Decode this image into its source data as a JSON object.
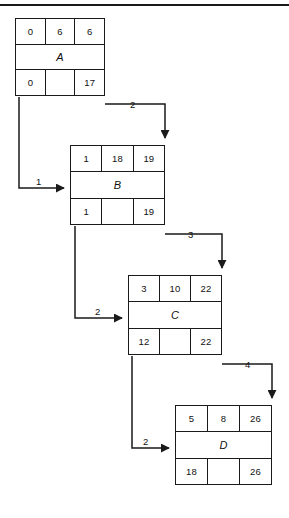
{
  "figure": {
    "top_rule_color": "#1a1a1a",
    "line_color": "#1a1a1a",
    "background": "#ffffff"
  },
  "blocks": [
    {
      "id": "A",
      "label": "A",
      "top": [
        "0",
        "6",
        "6"
      ],
      "bottom": [
        "0",
        "",
        "17"
      ],
      "x": 15,
      "y": 18,
      "w": 90,
      "h": 78
    },
    {
      "id": "B",
      "label": "B",
      "top": [
        "1",
        "18",
        "19"
      ],
      "bottom": [
        "1",
        "",
        "19"
      ],
      "x": 70,
      "y": 145,
      "w": 95,
      "h": 80
    },
    {
      "id": "C",
      "label": "C",
      "top": [
        "3",
        "10",
        "22"
      ],
      "bottom": [
        "12",
        "",
        "22"
      ],
      "x": 128,
      "y": 275,
      "w": 94,
      "h": 80
    },
    {
      "id": "D",
      "label": "D",
      "top": [
        "5",
        "8",
        "26"
      ],
      "bottom": [
        "18",
        "",
        "26"
      ],
      "x": 175,
      "y": 405,
      "w": 97,
      "h": 80
    }
  ],
  "connectors": [
    {
      "name": "a-to-b-right",
      "from": "A",
      "to": "B",
      "weight": "2",
      "label_x": 130,
      "label_y": 99
    },
    {
      "name": "a-to-b-left",
      "from": "A",
      "to": "B",
      "weight": "1",
      "label_x": 36,
      "label_y": 176
    },
    {
      "name": "b-to-c-right",
      "from": "B",
      "to": "C",
      "weight": "3",
      "label_x": 188,
      "label_y": 229
    },
    {
      "name": "b-to-c-left",
      "from": "B",
      "to": "C",
      "weight": "2",
      "label_x": 95,
      "label_y": 306
    },
    {
      "name": "c-to-d-right",
      "from": "C",
      "to": "D",
      "weight": "4",
      "label_x": 245,
      "label_y": 359
    },
    {
      "name": "c-to-d-left",
      "from": "C",
      "to": "D",
      "weight": "2",
      "label_x": 143,
      "label_y": 436
    }
  ],
  "caption": {
    "text": ""
  }
}
